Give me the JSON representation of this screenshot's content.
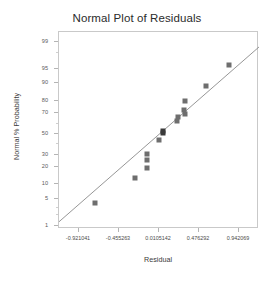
{
  "chart_data": {
    "type": "scatter",
    "title": "Normal Plot of Residuals",
    "xlabel": "Residual",
    "ylabel": "Normal % Probability",
    "grid": false,
    "legend": null,
    "xlim": [
      -1.1538,
      1.1748
    ],
    "ylim_percent": [
      0.8,
      99.5
    ],
    "x_ticks": [
      -0.921041,
      -0.455263,
      0.0105142,
      0.476292,
      0.942069
    ],
    "x_tick_labels": [
      "-0.921041",
      "-0.455263",
      "0.0105142",
      "0.476292",
      "0.942069"
    ],
    "y_ticks": [
      1,
      5,
      10,
      20,
      30,
      50,
      70,
      80,
      90,
      95,
      99
    ],
    "y_tick_labels": [
      "1",
      "5",
      "10",
      "20",
      "30",
      "50",
      "70",
      "80",
      "90",
      "95",
      "99"
    ],
    "y_scale": "normal-probability",
    "points": [
      {
        "x": -0.73,
        "percent": 4.0
      },
      {
        "x": -0.265,
        "percent": 13.0
      },
      {
        "x": -0.135,
        "percent": 19.5
      },
      {
        "x": -0.135,
        "percent": 30.5
      },
      {
        "x": -0.125,
        "percent": 25.0
      },
      {
        "x": 0.005,
        "percent": 44.0
      },
      {
        "x": 0.055,
        "percent": 50.5
      },
      {
        "x": 0.06,
        "percent": 53.0
      },
      {
        "x": 0.225,
        "percent": 63.0
      },
      {
        "x": 0.235,
        "percent": 66.0
      },
      {
        "x": 0.305,
        "percent": 72.5
      },
      {
        "x": 0.31,
        "percent": 80.0
      },
      {
        "x": 0.315,
        "percent": 69.5
      },
      {
        "x": 0.555,
        "percent": 88.5
      },
      {
        "x": 0.82,
        "percent": 96.0
      }
    ],
    "reference_line": {
      "label": "normal reference line",
      "x_start": -1.1538,
      "x_end": 1.1748,
      "percent_start": 1.3,
      "percent_end": 98.6
    },
    "colors": {
      "marker": "#6e6e6e",
      "marker_dark": "#3a3a3a",
      "line": "#8a8a8a",
      "frame": "#c9c9c9",
      "text": "#3a3a3a",
      "background": "#ffffff"
    }
  }
}
